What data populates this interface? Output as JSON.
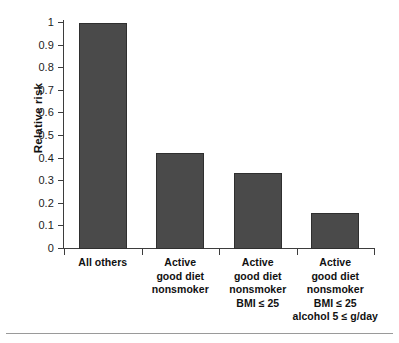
{
  "chart_data": {
    "type": "bar",
    "title": "",
    "xlabel": "",
    "ylabel": "Relative risk",
    "ylim": [
      0,
      1
    ],
    "grid": false,
    "legend": null,
    "categories": [
      "All others",
      "Active good diet nonsmoker",
      "Active good diet nonsmoker BMI ≤ 25",
      "Active good diet nonsmoker BMI ≤ 25 alcohol 5 ≤ g/day"
    ],
    "category_lines": [
      [
        "All others"
      ],
      [
        "Active",
        "good diet",
        "nonsmoker"
      ],
      [
        "Active",
        "good diet",
        "nonsmoker",
        "BMI ≤ 25"
      ],
      [
        "Active",
        "good diet",
        "nonsmoker",
        "BMI ≤ 25",
        "alcohol 5 ≤ g/day"
      ]
    ],
    "values": [
      1.0,
      0.425,
      0.335,
      0.16
    ],
    "ytick_labels": [
      "1",
      "0.9",
      "0.8",
      "0.7",
      "0.6",
      "0.5",
      "0.4",
      "0.3",
      "0.2",
      "0.1",
      "0"
    ],
    "ytick_values": [
      1,
      0.9,
      0.8,
      0.7,
      0.6,
      0.5,
      0.4,
      0.3,
      0.2,
      0.1,
      0
    ],
    "bar_color": "#4a4a4a",
    "bar_border_color": "#2f2f2f",
    "axis_color": "#3d3d3d"
  }
}
